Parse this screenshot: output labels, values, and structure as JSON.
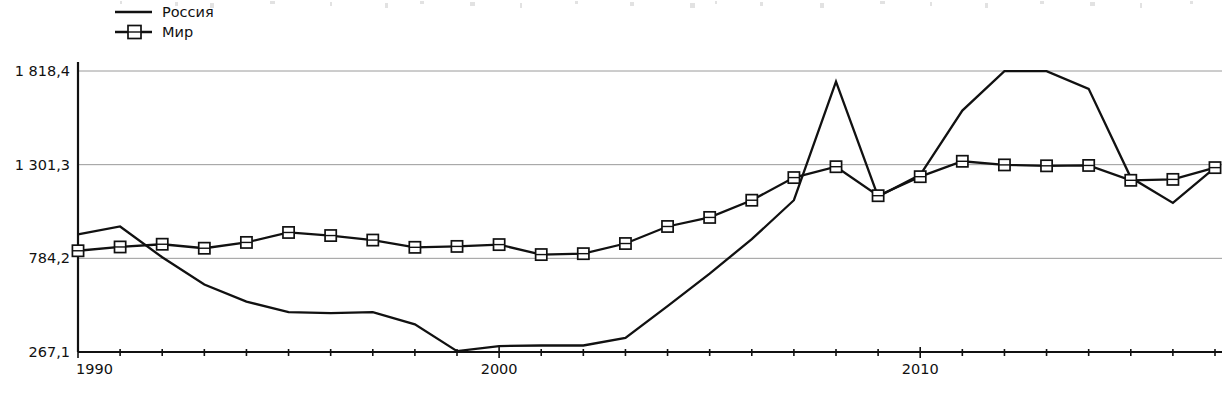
{
  "chart_data": {
    "type": "line",
    "title": "",
    "subtitle": "",
    "xlabel": "",
    "ylabel": "",
    "x": [
      1990,
      1991,
      1992,
      1993,
      1994,
      1995,
      1996,
      1997,
      1998,
      1999,
      2000,
      2001,
      2002,
      2003,
      2004,
      2005,
      2006,
      2007,
      2008,
      2009,
      2010,
      2011,
      2012,
      2013,
      2014,
      2015,
      2016,
      2017
    ],
    "xlim": [
      1990,
      2017
    ],
    "ylim": [
      267.1,
      1818.4
    ],
    "y_ticks": [
      267.1,
      784.2,
      1301.3,
      1818.4
    ],
    "y_tick_labels": [
      "267,1",
      "784,2",
      "1 301,3",
      "1 818,4"
    ],
    "x_tick_labels": [
      "1990",
      "2000",
      "2010"
    ],
    "x_labeled_years": [
      1990,
      2000,
      2010
    ],
    "grid": true,
    "legend_position": "top-left",
    "series": [
      {
        "name": "Россия",
        "marker": "none",
        "color": "#111111",
        "values": [
          916,
          960,
          790,
          640,
          545,
          487,
          482,
          487,
          420,
          272,
          300,
          303,
          303,
          345,
          520,
          700,
          890,
          1105,
          1760,
          1125,
          1245,
          1600,
          1818,
          1818,
          1720,
          1230,
          1090,
          1285
        ]
      },
      {
        "name": "Мир",
        "marker": "square",
        "color": "#111111",
        "values": [
          826,
          847,
          862,
          840,
          872,
          927,
          910,
          885,
          845,
          850,
          860,
          805,
          810,
          866,
          960,
          1010,
          1105,
          1230,
          1290,
          1130,
          1235,
          1320,
          1300,
          1295,
          1297,
          1215,
          1220,
          1285
        ]
      }
    ],
    "annotations": []
  },
  "legend": {
    "items": [
      {
        "label": "Россия",
        "style": "plain-line"
      },
      {
        "label": "Мир",
        "style": "line-with-square-marker"
      }
    ]
  },
  "axes": {
    "y_labels": [
      "1 818,4",
      "1 301,3",
      "784,2",
      "267,1"
    ],
    "x_labels": [
      "1990",
      "2000",
      "2010"
    ]
  },
  "ghost_top_text": ""
}
